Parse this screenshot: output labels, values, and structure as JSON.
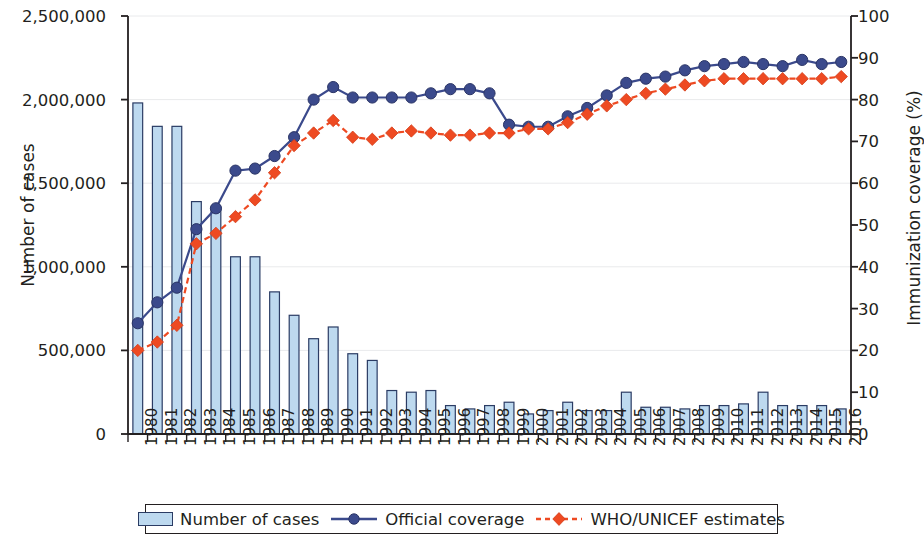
{
  "axes": {
    "left_title": "Number of cases",
    "right_title": "Immunization coverage (%)",
    "left_ticks": [
      "2,500,000",
      "2,000,000",
      "1,500,000",
      "1,000,000",
      "500,000",
      "0"
    ],
    "right_ticks": [
      "100",
      "90",
      "80",
      "70",
      "60",
      "50",
      "40",
      "30",
      "20",
      "10",
      "0"
    ]
  },
  "legend": {
    "bars_label": "Number of cases",
    "official_label": "Official coverage",
    "estimates_label": "WHO/UNICEF estimates"
  },
  "colors": {
    "bar_fill": "#bdd9ef",
    "bar_stroke": "#2b3c64",
    "official_line": "#3b4a8c",
    "official_marker": "#3b4a8c",
    "estimates_line": "#ee4a22",
    "estimates_marker": "#ee4a22",
    "axis": "#231f20",
    "grid": "#e9eaec"
  },
  "chart_data": {
    "type": "bar",
    "title": "",
    "xlabel": "",
    "ylabel": "Number of cases",
    "y2label": "Immunization coverage (%)",
    "ylim": [
      0,
      2500000
    ],
    "y2lim": [
      0,
      100
    ],
    "grid": true,
    "legend_position": "bottom",
    "categories": [
      "1980",
      "1981",
      "1982",
      "1983",
      "1984",
      "1985",
      "1986",
      "1987",
      "1988",
      "1989",
      "1990",
      "1991",
      "1992",
      "1993",
      "1994",
      "1995",
      "1996",
      "1997",
      "1998",
      "1999",
      "2000",
      "2001",
      "2002",
      "2003",
      "2004",
      "2005",
      "2006",
      "2007",
      "2008",
      "2009",
      "2010",
      "2011",
      "2012",
      "2013",
      "2014",
      "2015",
      "2016"
    ],
    "series": [
      {
        "name": "Number of cases",
        "type": "bar",
        "axis": "left",
        "values": [
          1980000,
          1840000,
          1840000,
          1390000,
          1350000,
          1060000,
          1060000,
          850000,
          710000,
          570000,
          640000,
          480000,
          440000,
          260000,
          250000,
          260000,
          170000,
          150000,
          170000,
          190000,
          120000,
          140000,
          190000,
          140000,
          140000,
          250000,
          160000,
          160000,
          150000,
          170000,
          170000,
          180000,
          250000,
          170000,
          170000,
          170000,
          150000
        ]
      },
      {
        "name": "Official coverage",
        "type": "line",
        "axis": "right",
        "values": [
          26.5,
          31.5,
          35,
          49,
          54,
          63,
          63.5,
          66.5,
          71,
          80,
          83,
          80.5,
          80.5,
          80.5,
          80.5,
          81.5,
          82.5,
          82.5,
          81.5,
          74,
          73.5,
          73.5,
          76,
          78,
          81,
          84,
          85,
          85.5,
          87,
          88,
          88.5,
          89,
          88.5,
          88,
          89.5,
          88.5,
          89
        ]
      },
      {
        "name": "WHO/UNICEF estimates",
        "type": "line",
        "axis": "right",
        "values": [
          20,
          22,
          26,
          45.5,
          48,
          52,
          56,
          62.5,
          69,
          72,
          75,
          71,
          70.5,
          72,
          72.5,
          72,
          71.5,
          71.5,
          72,
          72,
          73,
          73,
          74.5,
          76.5,
          78.5,
          80,
          81.5,
          82.5,
          83.5,
          84.5,
          85,
          85,
          85,
          85,
          85,
          85,
          85.5
        ]
      }
    ]
  }
}
